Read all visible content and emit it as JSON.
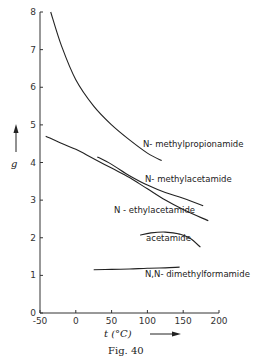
{
  "figure": {
    "caption": "Fig. 40"
  },
  "chart_data": {
    "type": "line",
    "title": "",
    "xlabel": "t (°C)",
    "ylabel": "g",
    "xlim": [
      -50,
      200
    ],
    "ylim": [
      0,
      8
    ],
    "xticks": [
      -50,
      0,
      50,
      100,
      150,
      200
    ],
    "yticks": [
      0,
      1,
      2,
      3,
      4,
      5,
      6,
      7,
      8
    ],
    "grid": false,
    "legend": "inline labels",
    "series": [
      {
        "name": "N-methylpropionamide",
        "label": "N- methylpropionamide",
        "x": [
          -35,
          -20,
          0,
          25,
          50,
          75,
          100,
          120
        ],
        "y": [
          8.0,
          7.1,
          6.2,
          5.5,
          5.0,
          4.6,
          4.25,
          4.05
        ]
      },
      {
        "name": "N-methylacetamide",
        "label": "N- methylacetamide",
        "x": [
          30,
          50,
          75,
          100,
          125,
          150,
          178
        ],
        "y": [
          4.15,
          3.95,
          3.65,
          3.4,
          3.2,
          3.05,
          2.85
        ]
      },
      {
        "name": "N-ethylacetamide",
        "label": "N - ethylacetamide",
        "x": [
          -42,
          -25,
          0,
          25,
          50,
          75,
          100,
          125,
          150,
          185
        ],
        "y": [
          4.7,
          4.55,
          4.35,
          4.1,
          3.85,
          3.6,
          3.3,
          3.0,
          2.75,
          2.45
        ]
      },
      {
        "name": "acetamide",
        "label": "acetamide",
        "x": [
          90,
          105,
          125,
          145,
          160,
          174
        ],
        "y": [
          2.07,
          2.13,
          2.15,
          2.1,
          1.98,
          1.75
        ]
      },
      {
        "name": "N,N-dimethylformamide",
        "label": "N,N- dimethylformamide",
        "x": [
          25,
          50,
          75,
          100,
          125,
          145
        ],
        "y": [
          1.15,
          1.16,
          1.17,
          1.19,
          1.2,
          1.22
        ]
      }
    ]
  }
}
